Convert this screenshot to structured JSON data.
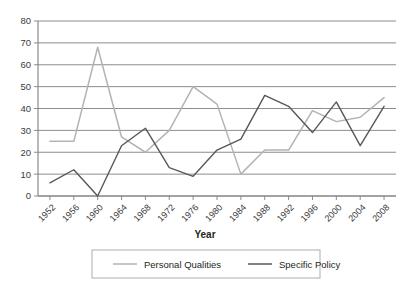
{
  "chart_data": {
    "type": "line",
    "title": "",
    "xlabel": "Year",
    "ylabel": "",
    "categories": [
      "1952",
      "1956",
      "1960",
      "1964",
      "1968",
      "1972",
      "1976",
      "1980",
      "1984",
      "1988",
      "1992",
      "1996",
      "2000",
      "2004",
      "2008"
    ],
    "series": [
      {
        "name": "Personal Qualities",
        "color": "#b3b3b3",
        "values": [
          25,
          25,
          68,
          27,
          20,
          30,
          50,
          42,
          10,
          21,
          21,
          39,
          34,
          36,
          45
        ]
      },
      {
        "name": "Specific Policy",
        "color": "#58585a",
        "values": [
          6,
          12,
          0,
          23,
          31,
          13,
          9,
          21,
          26,
          46,
          41,
          29,
          43,
          23,
          41
        ]
      }
    ],
    "ylim": [
      0,
      80
    ],
    "yticks": [
      0,
      10,
      20,
      30,
      40,
      50,
      60,
      70,
      80
    ],
    "ytick_labels": [
      "0",
      "10",
      "20",
      "30",
      "40",
      "50",
      "60",
      "70",
      "80"
    ],
    "grid": "horizontal",
    "legend_position": "bottom",
    "xtick_label_rotation": -45
  },
  "axis": {
    "x_title": "Year"
  },
  "legend": {
    "entries": [
      {
        "label": "Personal Qualities",
        "color": "#b3b3b3"
      },
      {
        "label": "Specific Policy",
        "color": "#58585a"
      }
    ]
  }
}
